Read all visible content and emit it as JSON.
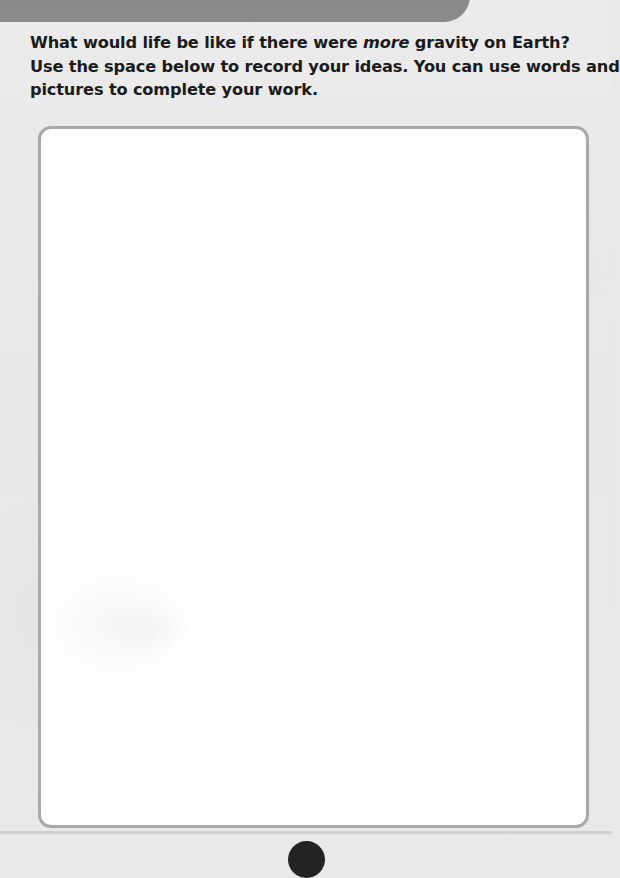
{
  "page": {
    "background_color": "#e9e9e9",
    "width": 612,
    "height": 854
  },
  "top_banner": {
    "color": "#8a8a8a",
    "glyph_name": "clipped-text-descender"
  },
  "prompt": {
    "line1_before_emphasis": "What would life be like if there were ",
    "line1_emphasis": "more",
    "line1_after_emphasis": " gravity on Earth?",
    "line2": "Use the space below to record your ideas. You can use words and",
    "line3": "pictures to complete your work."
  },
  "response_box": {
    "placeholder": "",
    "value": "",
    "border_color": "#a9a9a9",
    "fill_color": "#fefefe"
  },
  "footer": {
    "page_number": "",
    "badge_color": "#232323"
  }
}
